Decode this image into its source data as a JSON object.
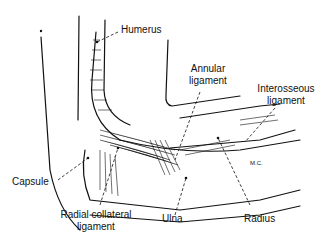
{
  "figure": {
    "labels": {
      "humerus": "Humerus",
      "annular_1": "Annular",
      "annular_2": "ligament",
      "interosseous_1": "Interosseous",
      "interosseous_2": "ligament",
      "capsule": "Capsule",
      "radial_collateral_1": "Radial collateral",
      "radial_collateral_2": "ligament",
      "ulna": "Ulna",
      "radius": "Radius"
    },
    "initials": "M.C."
  },
  "colors": {
    "ink": "#111111",
    "background": "#ffffff"
  }
}
